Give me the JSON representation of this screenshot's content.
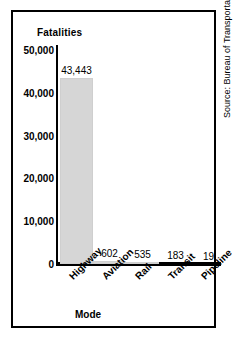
{
  "chart_data": {
    "type": "bar",
    "title": "",
    "ylabel": "Fatalities",
    "xlabel": "Mode",
    "categories": [
      "Highway",
      "Aviation",
      "Rail",
      "Transit",
      "Pipeline"
    ],
    "values": [
      43443,
      602,
      535,
      183,
      19
    ],
    "value_labels": [
      "43,443",
      "602",
      "535",
      "183",
      "19"
    ],
    "ylim": [
      0,
      50000
    ],
    "yticks": [
      0,
      10000,
      20000,
      30000,
      40000,
      50000
    ],
    "ytick_labels": [
      "0",
      "10,000",
      "20,000",
      "30,000",
      "40,000",
      "50,000"
    ],
    "grid": false,
    "legend": null,
    "bar_color": "#d6d6d6",
    "axis_color": "#000000"
  },
  "source_note": "Source: Bureau of Transportation Statistics."
}
